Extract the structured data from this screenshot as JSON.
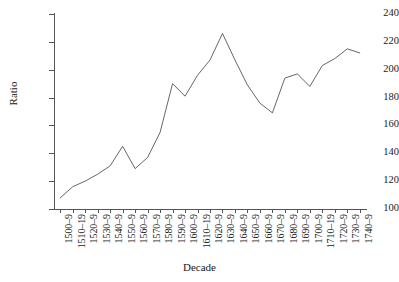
{
  "chart_data": {
    "type": "line",
    "title": "",
    "xlabel": "Decade",
    "ylabel": "Ratio",
    "ylim": [
      100,
      240
    ],
    "ytick_step": 20,
    "yticks": [
      100,
      120,
      140,
      160,
      180,
      200,
      220,
      240
    ],
    "grid": false,
    "legend": "none",
    "line_color": "#555555",
    "categories": [
      "1500–9",
      "1510–19",
      "1520–9",
      "1530–9",
      "1540–9",
      "1550–9",
      "1560–9",
      "1570–9",
      "1580–9",
      "1590–9",
      "1600–9",
      "1610–19",
      "1620–9",
      "1630–9",
      "1640–9",
      "1650–9",
      "1660–9",
      "1670–9",
      "1680–9",
      "1690–9",
      "1700–9",
      "1710–19",
      "1720–9",
      "1730–9",
      "1740–9"
    ],
    "values": [
      108,
      116,
      120,
      125,
      131,
      145,
      129,
      137,
      155,
      190,
      181,
      196,
      207,
      226,
      207,
      189,
      176,
      169,
      194,
      197,
      188,
      203,
      208,
      215,
      212
    ]
  }
}
